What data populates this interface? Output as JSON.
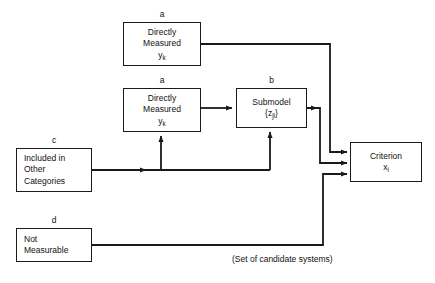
{
  "diagram": {
    "caption": "(Set of candidate systems)",
    "stroke_color": "#1a1a1a",
    "background_color": "#ffffff",
    "nodes": [
      {
        "id": "directly-measured-top",
        "tag": "a",
        "lines": [
          "Directly",
          "Measured",
          "y"
        ],
        "subscript": "k",
        "align": "center"
      },
      {
        "id": "directly-measured-mid",
        "tag": "a",
        "lines": [
          "Directly",
          "Measured",
          "y"
        ],
        "subscript": "k",
        "align": "center"
      },
      {
        "id": "submodel",
        "tag": "b",
        "lines": [
          "Submodel",
          "{z"
        ],
        "subscript": "ji",
        "align": "center"
      },
      {
        "id": "included-in-other-categories",
        "tag": "c",
        "lines": [
          "Included in",
          "Other",
          "Categories"
        ],
        "subscript": "",
        "align": "left"
      },
      {
        "id": "not-measurable",
        "tag": "d",
        "lines": [
          "Not",
          "Measurable"
        ],
        "subscript": "",
        "align": "left"
      },
      {
        "id": "criterion",
        "tag": "",
        "lines": [
          "Criterion",
          "x"
        ],
        "subscript": "i",
        "align": "center"
      }
    ],
    "labels": {
      "tag_a_top": "a",
      "tag_a_mid": "a",
      "tag_b": "b",
      "tag_c": "c",
      "tag_d": "d",
      "directly_line1": "Directly",
      "directly_line2": "Measured",
      "y_symbol": "y",
      "y_subscript": "k",
      "submodel_title": "Submodel",
      "z_open": "{",
      "z_symbol": "z",
      "z_subscript": "ji",
      "z_close": "}",
      "included_line1": "Included in",
      "included_line2": "Other",
      "included_line3": "Categories",
      "notmeas_line1": "Not",
      "notmeas_line2": "Measurable",
      "criterion_title": "Criterion",
      "x_symbol": "x",
      "x_subscript": "i"
    }
  }
}
